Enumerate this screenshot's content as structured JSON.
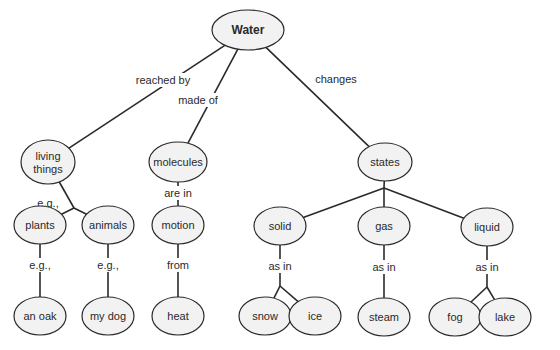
{
  "diagram": {
    "type": "concept-map",
    "root": "Water",
    "colors": {
      "stroke": "#2a2a2a",
      "node_fill": "#f2f2f2",
      "background": "#ffffff"
    },
    "nodes": [
      {
        "id": "water",
        "label": "Water",
        "cx": 248,
        "cy": 30,
        "rx": 36,
        "ry": 20,
        "root": true
      },
      {
        "id": "living",
        "label": [
          "living",
          "things"
        ],
        "cx": 48,
        "cy": 162,
        "rx": 27,
        "ry": 22
      },
      {
        "id": "molecules",
        "label": "molecules",
        "cx": 178,
        "cy": 162,
        "rx": 29,
        "ry": 20
      },
      {
        "id": "states",
        "label": "states",
        "cx": 385,
        "cy": 162,
        "rx": 27,
        "ry": 19
      },
      {
        "id": "plants",
        "label": "plants",
        "cx": 40,
        "cy": 225,
        "rx": 26,
        "ry": 19
      },
      {
        "id": "animals",
        "label": "animals",
        "cx": 108,
        "cy": 225,
        "rx": 26,
        "ry": 19
      },
      {
        "id": "motion",
        "label": "motion",
        "cx": 178,
        "cy": 225,
        "rx": 26,
        "ry": 19
      },
      {
        "id": "solid",
        "label": "solid",
        "cx": 280,
        "cy": 226,
        "rx": 26,
        "ry": 19
      },
      {
        "id": "gas",
        "label": "gas",
        "cx": 384,
        "cy": 226,
        "rx": 26,
        "ry": 19
      },
      {
        "id": "liquid",
        "label": "liquid",
        "cx": 487,
        "cy": 227,
        "rx": 26,
        "ry": 19
      },
      {
        "id": "anoak",
        "label": "an oak",
        "cx": 40,
        "cy": 316,
        "rx": 26,
        "ry": 19
      },
      {
        "id": "mydog",
        "label": "my dog",
        "cx": 108,
        "cy": 316,
        "rx": 26,
        "ry": 19
      },
      {
        "id": "heat",
        "label": "heat",
        "cx": 178,
        "cy": 316,
        "rx": 26,
        "ry": 19
      },
      {
        "id": "snow",
        "label": "snow",
        "cx": 265,
        "cy": 316,
        "rx": 26,
        "ry": 19
      },
      {
        "id": "ice",
        "label": "ice",
        "cx": 315,
        "cy": 316,
        "rx": 26,
        "ry": 19
      },
      {
        "id": "steam",
        "label": "steam",
        "cx": 384,
        "cy": 317,
        "rx": 26,
        "ry": 19
      },
      {
        "id": "fog",
        "label": "fog",
        "cx": 455,
        "cy": 317,
        "rx": 26,
        "ry": 19
      },
      {
        "id": "lake",
        "label": "lake",
        "cx": 505,
        "cy": 317,
        "rx": 26,
        "ry": 19
      }
    ],
    "links": [
      {
        "from": "water",
        "to": "living",
        "label": "reached by",
        "lx": 163,
        "ly": 80
      },
      {
        "from": "water",
        "to": "molecules",
        "label": "made of",
        "lx": 198,
        "ly": 100
      },
      {
        "from": "water",
        "to": "states",
        "label": "changes",
        "lx": 336,
        "ly": 79
      },
      {
        "from": "living",
        "to": [
          "plants",
          "animals"
        ],
        "label": "e.g.,",
        "lx": 48,
        "ly": 203,
        "jx": 74,
        "jy": 208
      },
      {
        "from": "molecules",
        "to": "motion",
        "label": "are in",
        "lx": 178,
        "ly": 193
      },
      {
        "from": "states",
        "to": [
          "solid",
          "gas",
          "liquid"
        ],
        "label": "can be",
        "lx": 384,
        "ly": 174,
        "jx": 384,
        "jy": 188
      },
      {
        "from": "plants",
        "to": "anoak",
        "label": "e.g.,",
        "lx": 40,
        "ly": 265
      },
      {
        "from": "animals",
        "to": "mydog",
        "label": "e.g.,",
        "lx": 108,
        "ly": 265
      },
      {
        "from": "motion",
        "to": "heat",
        "label": "from",
        "lx": 178,
        "ly": 265
      },
      {
        "from": "solid",
        "to": [
          "snow",
          "ice"
        ],
        "label": "as in",
        "lx": 280,
        "ly": 266,
        "jx": 280,
        "jy": 286
      },
      {
        "from": "gas",
        "to": "steam",
        "label": "as in",
        "lx": 384,
        "ly": 267
      },
      {
        "from": "liquid",
        "to": [
          "fog",
          "lake"
        ],
        "label": "as in",
        "lx": 487,
        "ly": 267,
        "jx": 487,
        "jy": 287
      }
    ]
  }
}
